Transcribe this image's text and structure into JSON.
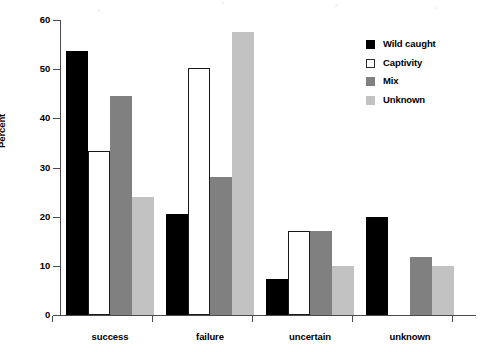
{
  "chart_data": {
    "type": "bar",
    "title": "",
    "subtitle": "",
    "xlabel": "",
    "ylabel": "Percent",
    "categories": [
      "success",
      "failure",
      "uncertain",
      "unknown"
    ],
    "series": [
      {
        "name": "Wild caught",
        "color": "#000000",
        "values": [
          53.6,
          20.5,
          7.3,
          20.0
        ]
      },
      {
        "name": "Captivity",
        "color": "#ffffff",
        "values": [
          33.3,
          50.2,
          17.0,
          0.0
        ]
      },
      {
        "name": "Mix",
        "color": "#808080",
        "values": [
          44.5,
          28.0,
          17.0,
          11.9
        ]
      },
      {
        "name": "Unknown",
        "color": "#c2c2c2",
        "values": [
          24.0,
          57.5,
          10.0,
          10.0
        ]
      }
    ],
    "ylim": [
      0,
      60
    ],
    "y_ticks": [
      0,
      10,
      20,
      30,
      40,
      50,
      60
    ],
    "y_tick_labels": [
      "0",
      "10",
      "20",
      "30",
      "40",
      "50",
      "60"
    ],
    "grid": false,
    "legend_position": "top-right"
  },
  "legend": {
    "entries": [
      {
        "label": "Wild caught"
      },
      {
        "label": "Captivity"
      },
      {
        "label": "Mix"
      },
      {
        "label": "Unknown"
      }
    ]
  }
}
